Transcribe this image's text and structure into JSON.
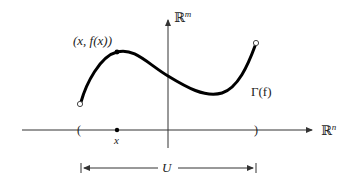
{
  "diagram": {
    "type": "function-graph",
    "colors": {
      "curve": "#000000",
      "axes": "#333333",
      "text": "#222222",
      "background": "#ffffff"
    },
    "labels": {
      "vertical_axis": "ℝ",
      "vertical_axis_sup": "m",
      "horizontal_axis": "ℝ",
      "horizontal_axis_sup": "n",
      "point_label": "(x, f(x))",
      "graph_label": "Γ(f)",
      "x_label": "x",
      "domain_label": "U",
      "left_bracket": "(",
      "right_bracket": ")"
    },
    "elements": {
      "curve": "Graph of f over open set U, with open endpoints",
      "open_endpoints": 2,
      "marked_point": "(x, f(x))",
      "domain_interval": "U"
    }
  }
}
